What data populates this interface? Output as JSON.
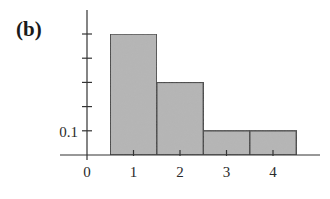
{
  "panel_label": "(b)",
  "colors": {
    "bar_fill": "#b5b5b5",
    "bar_stroke": "#444444",
    "axis": "#333333",
    "background": "#ffffff"
  },
  "chart_data": {
    "type": "bar",
    "title": "(b)",
    "xlabel": "",
    "ylabel": "",
    "categories": [
      "1",
      "2",
      "3",
      "4"
    ],
    "x": [
      1,
      2,
      3,
      4
    ],
    "values": [
      0.5,
      0.3,
      0.1,
      0.1
    ],
    "x_tick_labels": [
      "0",
      "1",
      "2",
      "3",
      "4"
    ],
    "y_tick_values": [
      0.1,
      0.2,
      0.3,
      0.4,
      0.5
    ],
    "y_tick_labels": [
      "0.1"
    ],
    "ylim": [
      0,
      0.6
    ],
    "xlim": [
      -0.6,
      4.9
    ],
    "grid": false,
    "legend": null,
    "bar_width": 1.0
  }
}
